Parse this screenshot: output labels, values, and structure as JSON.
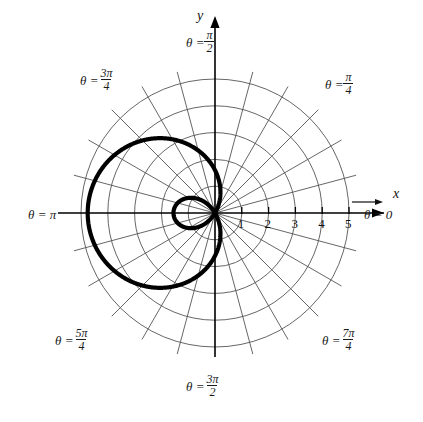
{
  "figure": {
    "axis_labels": {
      "x": "x",
      "y": "y"
    },
    "angle_labels": [
      {
        "name": "theta-pi-over-2",
        "lhs": "θ =",
        "num": "π",
        "den": "2",
        "degrees": 90
      },
      {
        "name": "theta-3pi-over-4",
        "lhs": "θ =",
        "num": "3π",
        "den": "4",
        "degrees": 135
      },
      {
        "name": "theta-pi-over-4",
        "lhs": "θ =",
        "num": "π",
        "den": "4",
        "degrees": 45
      },
      {
        "name": "theta-pi",
        "lhs": "θ = π",
        "num": "",
        "den": "",
        "degrees": 180
      },
      {
        "name": "theta-zero",
        "lhs": "θ = 0",
        "num": "",
        "den": "",
        "degrees": 0
      },
      {
        "name": "theta-5pi-over-4",
        "lhs": "θ =",
        "num": "5π",
        "den": "4",
        "degrees": 225
      },
      {
        "name": "theta-7pi-over-4",
        "lhs": "θ =",
        "num": "7π",
        "den": "4",
        "degrees": 315
      },
      {
        "name": "theta-3pi-over-2",
        "lhs": "θ =",
        "num": "3π",
        "den": "2",
        "degrees": 270
      }
    ],
    "x_tick_labels": [
      "1",
      "2",
      "3",
      "4",
      "5"
    ],
    "colors": {
      "curve": "#000000",
      "grid": "#555555",
      "axis": "#000000",
      "text": "#111111",
      "background": "#ffffff"
    }
  },
  "chart_data": {
    "type": "line",
    "title": "",
    "subtitle": "",
    "plot_kind": "polar",
    "curve_name": "limacon-with-inner-loop",
    "equation": "r = a + b cos(θ), b > a",
    "xlabel": "x",
    "ylabel": "y",
    "grid": true,
    "legend": null,
    "polar": {
      "radial_ticks": [
        1,
        2,
        3,
        4,
        5
      ],
      "radial_max": 5.45,
      "radial_tick_labels": [
        "1",
        "2",
        "3",
        "4",
        "5"
      ],
      "angular_gridlines_deg": [
        0,
        15,
        30,
        45,
        60,
        75,
        90,
        105,
        120,
        135,
        150,
        165,
        180,
        195,
        210,
        225,
        240,
        255,
        270,
        285,
        300,
        315,
        330,
        345
      ],
      "labeled_angles_deg": [
        0,
        45,
        90,
        135,
        180,
        225,
        270,
        315
      ],
      "labeled_angles_text": [
        "θ = 0",
        "θ = π/4",
        "θ = π/2",
        "θ = 3π/4",
        "θ = π",
        "θ = 5π/4",
        "θ = 3π/2",
        "θ = 7π/4"
      ]
    },
    "series": [
      {
        "name": "limacon",
        "formula_r_of_theta": "r = 1.6 + 3.15*cos(theta)",
        "a": 1.6,
        "b": 3.15,
        "orientation": "loop opens toward theta = 0, outer lobe toward theta = pi",
        "theta_deg": [
          0,
          15,
          30,
          45,
          60,
          75,
          90,
          105,
          120,
          135,
          150,
          165,
          180,
          195,
          210,
          225,
          240,
          255,
          270,
          285,
          300,
          315,
          330,
          345,
          360
        ],
        "r": [
          4.75,
          4.64,
          4.33,
          3.83,
          3.18,
          2.42,
          1.6,
          0.79,
          0.03,
          -0.63,
          -1.13,
          -1.44,
          -1.55,
          -1.44,
          -1.13,
          -0.63,
          0.03,
          0.79,
          1.6,
          2.42,
          3.18,
          3.83,
          4.33,
          4.64,
          4.75
        ],
        "extremes": {
          "max_radius": 4.75,
          "max_radius_at_theta_deg": 180,
          "inner_loop_max_radius": 1.55,
          "inner_loop_at_theta_deg": 0
        }
      }
    ],
    "xlim": [
      -5.45,
      5.45
    ],
    "ylim": [
      -5.45,
      5.45
    ]
  }
}
